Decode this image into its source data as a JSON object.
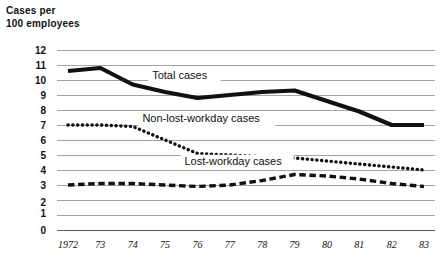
{
  "axis_title": "Cases per\n100 employees",
  "chart_data": {
    "type": "line",
    "title": "",
    "subtitle": "",
    "xlabel": "",
    "ylabel": "Cases per 100 employees",
    "x": [
      "1972",
      "73",
      "74",
      "75",
      "76",
      "77",
      "78",
      "79",
      "80",
      "81",
      "82",
      "83"
    ],
    "categories": [
      "1972",
      "73",
      "74",
      "75",
      "76",
      "77",
      "78",
      "79",
      "80",
      "81",
      "82",
      "83"
    ],
    "xtick_labels": [
      "1972",
      "73",
      "74",
      "75",
      "76",
      "77",
      "78",
      "79",
      "80",
      "81",
      "82",
      "83"
    ],
    "ytick_labels": [
      "12",
      "11",
      "10",
      "9",
      "8",
      "7",
      "6",
      "5",
      "4",
      "3",
      "2",
      "1",
      "0"
    ],
    "ylim": [
      0,
      12
    ],
    "yticks": [
      0,
      1,
      2,
      3,
      4,
      5,
      6,
      7,
      8,
      9,
      10,
      11,
      12
    ],
    "grid": true,
    "legend": "inline-labels",
    "series": [
      {
        "name": "Total cases",
        "style": "solid-thick",
        "values": [
          10.6,
          10.8,
          9.7,
          9.2,
          8.8,
          9.0,
          9.2,
          9.3,
          8.6,
          7.9,
          7.0,
          7.0
        ]
      },
      {
        "name": "Non-lost-workday cases",
        "style": "dotted",
        "values": [
          7.0,
          7.0,
          6.9,
          6.0,
          5.1,
          5.0,
          4.9,
          4.8,
          4.6,
          4.4,
          4.2,
          4.0
        ]
      },
      {
        "name": "Lost-workday cases",
        "style": "dashed",
        "values": [
          3.0,
          3.1,
          3.1,
          3.0,
          2.9,
          3.0,
          3.3,
          3.7,
          3.6,
          3.4,
          3.1,
          2.9
        ]
      }
    ],
    "annotations": [
      {
        "text": "Total cases",
        "x": "74.6",
        "y": 10.1
      },
      {
        "text": "Non-lost-workday cases",
        "x": "74.3",
        "y": 7.2
      },
      {
        "text": "Lost-workday cases",
        "x": "75.6",
        "y": 4.35
      }
    ],
    "colors": {
      "line": "#111111",
      "grid": "#8d8d8d",
      "axis": "#5a5a5a",
      "background": "#ffffff"
    }
  }
}
